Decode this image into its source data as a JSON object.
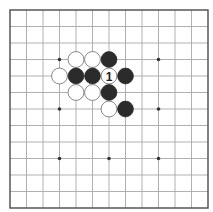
{
  "board": {
    "size": 13,
    "origin_px": [
      10,
      10
    ],
    "spacing_px": 16.5,
    "colors": {
      "background": "#ffffff",
      "grid": "#a8a8a8",
      "border": "#4a4a4a",
      "black_stone": "#2b2b2b",
      "white_stone": "#ffffff",
      "label": "#222222"
    },
    "star_points": [
      [
        3,
        3
      ],
      [
        9,
        3
      ],
      [
        3,
        6
      ],
      [
        9,
        6
      ],
      [
        3,
        9
      ],
      [
        6,
        9
      ],
      [
        9,
        9
      ]
    ],
    "stones": [
      {
        "col": 4,
        "row": 3,
        "color": "white"
      },
      {
        "col": 5,
        "row": 3,
        "color": "white"
      },
      {
        "col": 6,
        "row": 3,
        "color": "black"
      },
      {
        "col": 3,
        "row": 4,
        "color": "white"
      },
      {
        "col": 4,
        "row": 4,
        "color": "black"
      },
      {
        "col": 5,
        "row": 4,
        "color": "black"
      },
      {
        "col": 6,
        "row": 4,
        "color": "white",
        "label": "1"
      },
      {
        "col": 7,
        "row": 4,
        "color": "black"
      },
      {
        "col": 4,
        "row": 5,
        "color": "white"
      },
      {
        "col": 5,
        "row": 5,
        "color": "white"
      },
      {
        "col": 6,
        "row": 5,
        "color": "black"
      },
      {
        "col": 6,
        "row": 6,
        "color": "white"
      },
      {
        "col": 7,
        "row": 6,
        "color": "black"
      }
    ]
  }
}
